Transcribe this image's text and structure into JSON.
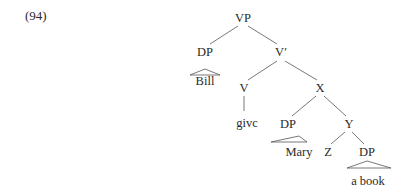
{
  "example_number": "(94)",
  "colors": {
    "text": "#2a2a2a",
    "line": "#555555",
    "background": "#ffffff"
  },
  "tree": {
    "root": "VP",
    "nodes": [
      {
        "id": "vp",
        "label": "VP",
        "x": 243,
        "y": 18
      },
      {
        "id": "dp1",
        "label": "DP",
        "x": 205,
        "y": 52
      },
      {
        "id": "bill",
        "label": "Bill",
        "x": 205,
        "y": 81
      },
      {
        "id": "vbar",
        "label": "V′",
        "x": 281,
        "y": 52
      },
      {
        "id": "v",
        "label": "V",
        "x": 244,
        "y": 88
      },
      {
        "id": "give",
        "label": "givc",
        "x": 247,
        "y": 123
      },
      {
        "id": "x",
        "label": "X",
        "x": 320,
        "y": 88
      },
      {
        "id": "dp2",
        "label": "DP",
        "x": 288,
        "y": 124
      },
      {
        "id": "mary",
        "label": "Mary",
        "x": 299,
        "y": 152
      },
      {
        "id": "y",
        "label": "Y",
        "x": 349,
        "y": 124
      },
      {
        "id": "z",
        "label": "Z",
        "x": 328,
        "y": 152
      },
      {
        "id": "dp3",
        "label": "DP",
        "x": 367,
        "y": 152
      },
      {
        "id": "abook",
        "label": "a book",
        "x": 368,
        "y": 181
      }
    ],
    "edges": [
      {
        "from": "vp",
        "to": "dp1",
        "x1": 238,
        "y1": 26,
        "x2": 210,
        "y2": 44
      },
      {
        "from": "vp",
        "to": "vbar",
        "x1": 248,
        "y1": 26,
        "x2": 277,
        "y2": 44
      },
      {
        "from": "vbar",
        "to": "v",
        "x1": 277,
        "y1": 61,
        "x2": 248,
        "y2": 80
      },
      {
        "from": "vbar",
        "to": "x",
        "x1": 285,
        "y1": 61,
        "x2": 317,
        "y2": 80
      },
      {
        "from": "v",
        "to": "give",
        "x1": 244,
        "y1": 96,
        "x2": 244,
        "y2": 111
      },
      {
        "from": "x",
        "to": "dp2",
        "x1": 316,
        "y1": 96,
        "x2": 292,
        "y2": 116
      },
      {
        "from": "x",
        "to": "y",
        "x1": 324,
        "y1": 96,
        "x2": 346,
        "y2": 116
      },
      {
        "from": "y",
        "to": "z",
        "x1": 345,
        "y1": 132,
        "x2": 331,
        "y2": 144
      },
      {
        "from": "y",
        "to": "dp3",
        "x1": 352,
        "y1": 132,
        "x2": 364,
        "y2": 144
      }
    ],
    "triangles": [
      {
        "over": "bill",
        "points": "205,69 190,75 220,75"
      },
      {
        "over": "mary",
        "points": "299,136 271,142 307,142"
      },
      {
        "over": "abook",
        "points": "367,161 347,168 391,168"
      }
    ]
  }
}
